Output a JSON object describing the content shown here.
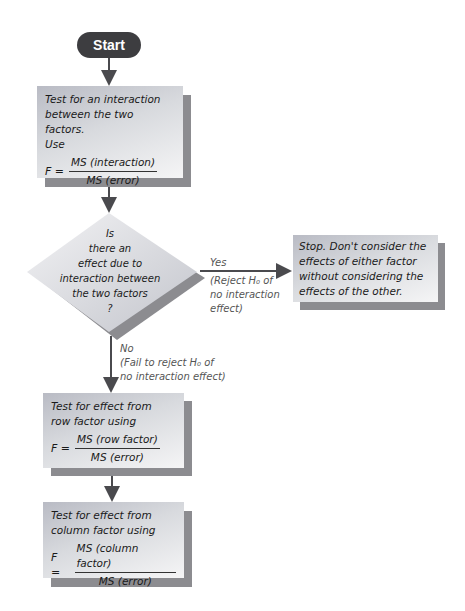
{
  "start": {
    "label": "Start"
  },
  "step_interaction": {
    "line1_prefix": "Test for an ",
    "line1_emph": "interaction",
    "line2": "between the two factors.",
    "line3": "Use",
    "f_label": "F =",
    "numerator": "MS (interaction)",
    "denominator": "MS (error)"
  },
  "decision": {
    "lines": [
      "Is",
      "there an",
      "effect due to",
      "interaction between",
      "the two factors",
      "?"
    ]
  },
  "yes_branch": {
    "label": "Yes",
    "note_lines": [
      "(Reject H₀ of",
      "no interaction",
      "effect)"
    ]
  },
  "stop": {
    "lines": [
      "Stop. Don't consider the",
      "effects of either factor",
      "without considering the",
      "effects of the other."
    ]
  },
  "no_branch": {
    "label": "No",
    "note_lines": [
      "(Fail to reject H₀ of",
      "no interaction effect)"
    ]
  },
  "step_row": {
    "line1": "Test for effect from",
    "line2": "row factor using",
    "f_label": "F =",
    "numerator": "MS (row factor)",
    "denominator": "MS (error)"
  },
  "step_column": {
    "line1": "Test for effect from",
    "line2": "column factor using",
    "f_label": "F =",
    "numerator": "MS (column factor)",
    "denominator": "MS (error)"
  },
  "colors": {
    "terminal": "#3d3d40",
    "connector": "#4a4a4e",
    "shadow": "#8c8c90",
    "box_light": "#f5f5f6",
    "box_dark": "#b9bbc4"
  }
}
